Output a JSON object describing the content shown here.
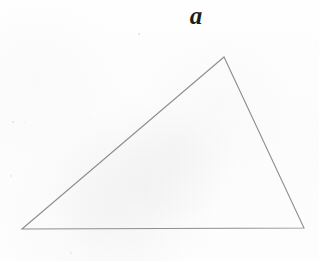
{
  "figure": {
    "caption_label": "a",
    "width": 319,
    "height": 261,
    "background_color": "#fdfdfd",
    "stroke_color": "#8f8f8f",
    "label_color": "#1d1d1a",
    "stroke_width": 1.1
  },
  "chart_data": {
    "type": "diagram",
    "title": "a",
    "shape": "triangle",
    "vertices": [
      {
        "name": "bottom-left",
        "x": 22,
        "y": 229
      },
      {
        "name": "apex",
        "x": 224,
        "y": 57
      },
      {
        "name": "bottom-right",
        "x": 304,
        "y": 228
      }
    ],
    "edges": [
      {
        "name": "base",
        "from": "bottom-left",
        "to": "bottom-right"
      },
      {
        "name": "left-side",
        "from": "bottom-left",
        "to": "apex"
      },
      {
        "name": "right-side",
        "from": "apex",
        "to": "bottom-right"
      }
    ],
    "labels": [
      {
        "text": "a",
        "x": 196,
        "y": 16,
        "style": "italic-serif"
      }
    ],
    "xlabel": "",
    "ylabel": "",
    "grid": false,
    "legend": false
  },
  "marks": {
    "specks": [
      {
        "x": 138,
        "y": 33,
        "size": 2.0,
        "opacity": 0.22
      },
      {
        "x": 139,
        "y": 36,
        "size": 1.4,
        "opacity": 0.16
      },
      {
        "x": 12,
        "y": 121,
        "size": 1.6,
        "opacity": 0.17
      },
      {
        "x": 24,
        "y": 122,
        "size": 1.3,
        "opacity": 0.14
      },
      {
        "x": 10,
        "y": 175,
        "size": 1.5,
        "opacity": 0.13
      },
      {
        "x": 88,
        "y": 118,
        "size": 1.2,
        "opacity": 0.12
      },
      {
        "x": 261,
        "y": 205,
        "size": 1.4,
        "opacity": 0.12
      },
      {
        "x": 296,
        "y": 97,
        "size": 1.3,
        "opacity": 0.1
      },
      {
        "x": 70,
        "y": 252,
        "size": 1.5,
        "opacity": 0.11
      },
      {
        "x": 204,
        "y": 247,
        "size": 1.3,
        "opacity": 0.1
      }
    ]
  }
}
